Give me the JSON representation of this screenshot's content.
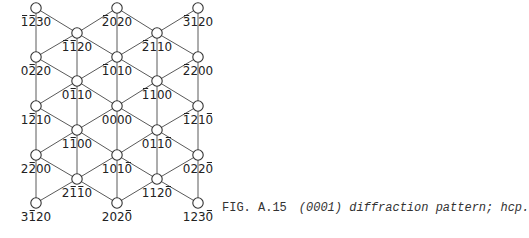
{
  "figure": {
    "number": "FIG. A.15",
    "caption": "(0001) diffraction pattern; hcp."
  },
  "nodes": [
    {
      "id": "n1",
      "x": 36,
      "y": 8,
      "label": "1230",
      "bars": [
        0,
        1
      ]
    },
    {
      "id": "n2",
      "x": 117,
      "y": 8,
      "label": "2020",
      "bars": [
        0
      ]
    },
    {
      "id": "n3",
      "x": 198,
      "y": 8,
      "label": "3120",
      "bars": [
        0
      ]
    },
    {
      "id": "n4",
      "x": 77,
      "y": 33,
      "label": "1120",
      "bars": [
        0,
        1
      ]
    },
    {
      "id": "n5",
      "x": 157,
      "y": 33,
      "label": "2110",
      "bars": [
        0
      ]
    },
    {
      "id": "n6",
      "x": 36,
      "y": 57,
      "label": "0220",
      "bars": [
        1
      ]
    },
    {
      "id": "n7",
      "x": 117,
      "y": 57,
      "label": "1010",
      "bars": [
        0
      ]
    },
    {
      "id": "n8",
      "x": 198,
      "y": 57,
      "label": "2200",
      "bars": [
        0
      ]
    },
    {
      "id": "n9",
      "x": 77,
      "y": 81,
      "label": "0110",
      "bars": [
        1
      ]
    },
    {
      "id": "n10",
      "x": 157,
      "y": 81,
      "label": "1100",
      "bars": [
        0
      ]
    },
    {
      "id": "n11",
      "x": 36,
      "y": 106,
      "label": "1210",
      "bars": [
        1
      ]
    },
    {
      "id": "n12",
      "x": 117,
      "y": 106,
      "label": "0000",
      "bars": []
    },
    {
      "id": "n13",
      "x": 198,
      "y": 106,
      "label": "1210",
      "bars": [
        0,
        3
      ]
    },
    {
      "id": "n14",
      "x": 77,
      "y": 130,
      "label": "1100",
      "bars": [
        1
      ]
    },
    {
      "id": "n15",
      "x": 157,
      "y": 130,
      "label": "0110",
      "bars": [
        3
      ]
    },
    {
      "id": "n16",
      "x": 36,
      "y": 155,
      "label": "2200",
      "bars": [
        1
      ]
    },
    {
      "id": "n17",
      "x": 117,
      "y": 155,
      "label": "1010",
      "bars": [
        3
      ]
    },
    {
      "id": "n18",
      "x": 198,
      "y": 155,
      "label": "0220",
      "bars": [
        3
      ]
    },
    {
      "id": "n19",
      "x": 77,
      "y": 179,
      "label": "2110",
      "bars": [
        1,
        2
      ]
    },
    {
      "id": "n20",
      "x": 157,
      "y": 179,
      "label": "1120",
      "bars": [
        3
      ]
    },
    {
      "id": "n21",
      "x": 36,
      "y": 203,
      "label": "3120",
      "bars": [
        1
      ]
    },
    {
      "id": "n22",
      "x": 117,
      "y": 203,
      "label": "2020",
      "bars": [
        3
      ]
    },
    {
      "id": "n23",
      "x": 198,
      "y": 203,
      "label": "1230",
      "bars": [
        3
      ]
    }
  ],
  "edges": [
    [
      "n1",
      "n4"
    ],
    [
      "n4",
      "n2"
    ],
    [
      "n2",
      "n5"
    ],
    [
      "n5",
      "n3"
    ],
    [
      "n1",
      "n6"
    ],
    [
      "n4",
      "n9"
    ],
    [
      "n2",
      "n7"
    ],
    [
      "n5",
      "n10"
    ],
    [
      "n3",
      "n8"
    ],
    [
      "n4",
      "n6"
    ],
    [
      "n4",
      "n7"
    ],
    [
      "n5",
      "n7"
    ],
    [
      "n5",
      "n8"
    ],
    [
      "n6",
      "n9"
    ],
    [
      "n9",
      "n7"
    ],
    [
      "n7",
      "n10"
    ],
    [
      "n10",
      "n8"
    ],
    [
      "n6",
      "n11"
    ],
    [
      "n9",
      "n14"
    ],
    [
      "n7",
      "n12"
    ],
    [
      "n10",
      "n15"
    ],
    [
      "n8",
      "n13"
    ],
    [
      "n9",
      "n11"
    ],
    [
      "n9",
      "n12"
    ],
    [
      "n10",
      "n12"
    ],
    [
      "n10",
      "n13"
    ],
    [
      "n11",
      "n14"
    ],
    [
      "n14",
      "n12"
    ],
    [
      "n12",
      "n15"
    ],
    [
      "n15",
      "n13"
    ],
    [
      "n11",
      "n16"
    ],
    [
      "n14",
      "n19"
    ],
    [
      "n12",
      "n17"
    ],
    [
      "n15",
      "n20"
    ],
    [
      "n13",
      "n18"
    ],
    [
      "n14",
      "n16"
    ],
    [
      "n14",
      "n17"
    ],
    [
      "n15",
      "n17"
    ],
    [
      "n15",
      "n18"
    ],
    [
      "n16",
      "n19"
    ],
    [
      "n19",
      "n17"
    ],
    [
      "n17",
      "n20"
    ],
    [
      "n20",
      "n18"
    ],
    [
      "n16",
      "n21"
    ],
    [
      "n17",
      "n22"
    ],
    [
      "n18",
      "n23"
    ],
    [
      "n19",
      "n21"
    ],
    [
      "n19",
      "n22"
    ],
    [
      "n20",
      "n22"
    ],
    [
      "n20",
      "n23"
    ]
  ],
  "style": {
    "line_color": "#5a5a5a",
    "node_stroke": "#333333",
    "text_color": "#222222"
  }
}
